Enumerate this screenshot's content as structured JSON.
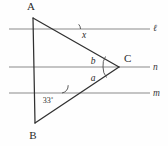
{
  "figure": {
    "kind": "geometry-diagram",
    "background_color": "#fefefe",
    "line_color": "#303030",
    "parallel_line_color": "#8a8a8a"
  },
  "vertices": [
    {
      "id": "A",
      "label": "A",
      "x": 33,
      "y": 18,
      "label_x": 31,
      "label_y": 10
    },
    {
      "id": "B",
      "label": "B",
      "x": 35,
      "y": 123,
      "label_x": 33,
      "label_y": 139
    },
    {
      "id": "C",
      "label": "C",
      "x": 119,
      "y": 67,
      "label_x": 124,
      "label_y": 62
    }
  ],
  "parallel_lines": [
    {
      "id": "l",
      "label": "ℓ",
      "y": 29,
      "x1": 9,
      "x2": 150,
      "label_x": 153,
      "label_y": 31
    },
    {
      "id": "n",
      "label": "n",
      "y": 67,
      "x1": 9,
      "x2": 150,
      "label_x": 153,
      "label_y": 70
    },
    {
      "id": "m",
      "label": "m",
      "y": 93,
      "x1": 9,
      "x2": 150,
      "label_x": 153,
      "label_y": 96
    }
  ],
  "sides": [
    {
      "id": "AB",
      "from": "A",
      "to": "B"
    },
    {
      "id": "AC",
      "from": "A",
      "to": "C"
    },
    {
      "id": "BC",
      "from": "B",
      "to": "C"
    }
  ],
  "angles": [
    {
      "id": "x",
      "label": "x",
      "label_x": 84,
      "label_y": 38,
      "vertex_x": 77,
      "vertex_y": 29,
      "arc_d": "M 80.5 29 A 7 7 0 0 0 78.7 24.3",
      "note": "angle between line l and side AC"
    },
    {
      "id": "b",
      "label": "b",
      "label_x": 93,
      "label_y": 64,
      "vertex_x": 119,
      "vertex_y": 67,
      "arc_d": "M 105.5 56.5 A 16 16 0 0 0 103 67",
      "note": "angle at C above line n, inside triangle"
    },
    {
      "id": "a",
      "label": "a",
      "label_x": 93,
      "label_y": 81,
      "vertex_x": 119,
      "vertex_y": 67,
      "arc_d": "M 103 67 A 16 16 0 0 0 106.5 77.5",
      "note": "angle at C below line n, inside triangle"
    },
    {
      "id": "angle33",
      "label": "33˚",
      "label_x": 48,
      "label_y": 103,
      "vertex_x": 69,
      "vertex_y": 93,
      "arc_d": "M 62 93 A 8 8 0 0 0 68.2 85.2",
      "note": "angle between line m and side BC"
    }
  ]
}
